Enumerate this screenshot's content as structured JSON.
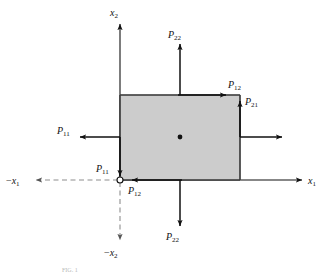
{
  "figure": {
    "caption_partial": "FIG. 1",
    "background_color": "#ffffff",
    "element_fill_color": "#cccccc",
    "element_stroke_color": "#333333",
    "line_color": "#111111",
    "dashed_axis_color": "#999999"
  },
  "axes": {
    "x1_positive": {
      "label_neg": "",
      "label_var": "x",
      "label_sub": "1",
      "direction": "right",
      "style": "solid"
    },
    "x1_negative": {
      "label_neg": "−",
      "label_var": "x",
      "label_sub": "1",
      "direction": "left",
      "style": "dashed"
    },
    "x2_positive": {
      "label_neg": "",
      "label_var": "x",
      "label_sub": "2",
      "direction": "up",
      "style": "solid"
    },
    "x2_negative": {
      "label_neg": "−",
      "label_var": "x",
      "label_sub": "2",
      "direction": "down",
      "style": "dashed"
    }
  },
  "origin": {
    "marker": "open-circle",
    "x": 120,
    "y": 180
  },
  "element": {
    "left": 120,
    "top": 95,
    "right": 240,
    "bottom": 180,
    "center_dot": {
      "x": 180,
      "y": 137
    }
  },
  "stress_labels": [
    {
      "id": "p22-top",
      "var": "P",
      "sub": "22",
      "text": "P22",
      "position": "top-outside",
      "arrow_direction": "up"
    },
    {
      "id": "p12-top",
      "var": "P",
      "sub": "12",
      "text": "P12",
      "position": "top-edge-right",
      "arrow_direction": "right"
    },
    {
      "id": "p21-right",
      "var": "P",
      "sub": "21",
      "text": "P21",
      "position": "right-edge-top",
      "arrow_direction": "up"
    },
    {
      "id": "p11-left",
      "var": "P",
      "sub": "11",
      "text": "P11",
      "position": "left-outside",
      "arrow_direction": "left"
    },
    {
      "id": "p11-origin",
      "var": "P",
      "sub": "11",
      "text": "P11",
      "position": "near-origin",
      "arrow_direction": "down"
    },
    {
      "id": "p12-bottom",
      "var": "P",
      "sub": "12",
      "text": "P12",
      "position": "bottom-edge",
      "arrow_direction": "left"
    },
    {
      "id": "p22-bottom",
      "var": "P",
      "sub": "22",
      "text": "P22",
      "position": "bottom-outside",
      "arrow_direction": "down"
    },
    {
      "id": "p11-right",
      "var": "",
      "sub": "",
      "text": "",
      "position": "right-outside",
      "arrow_direction": "right"
    }
  ]
}
